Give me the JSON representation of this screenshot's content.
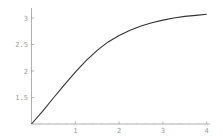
{
  "chart_data": {
    "type": "line",
    "title": "",
    "xlabel": "",
    "ylabel": "",
    "xlim": [
      0,
      4.05
    ],
    "ylim": [
      1.0,
      3.15
    ],
    "grid": false,
    "legend": null,
    "x_ticks": [
      "1",
      "2",
      "3",
      "4"
    ],
    "y_ticks": [
      "1.5",
      "2",
      "2.5",
      "3"
    ],
    "series": [
      {
        "name": "curve",
        "color": "#333333",
        "x": [
          0,
          0.25,
          0.5,
          0.75,
          1.0,
          1.25,
          1.5,
          1.75,
          2.0,
          2.25,
          2.5,
          2.75,
          3.0,
          3.25,
          3.5,
          3.75,
          4.0
        ],
        "y": [
          1.0,
          1.24,
          1.49,
          1.74,
          1.98,
          2.2,
          2.39,
          2.55,
          2.67,
          2.77,
          2.85,
          2.91,
          2.96,
          3.0,
          3.03,
          3.05,
          3.07
        ]
      }
    ]
  }
}
